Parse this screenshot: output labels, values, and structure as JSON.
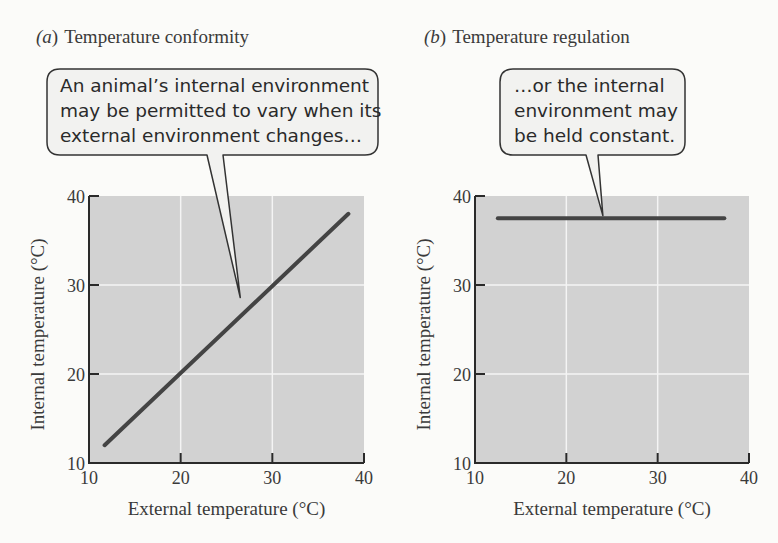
{
  "panels": [
    {
      "letter": "(a)",
      "title": "Temperature conformity",
      "callout": [
        "An animal’s internal environment",
        "may be permitted to vary when its",
        "external environment changes…"
      ]
    },
    {
      "letter": "(b)",
      "title": "Temperature regulation",
      "callout": [
        "…or the internal",
        "environment may",
        "be held constant."
      ]
    }
  ],
  "colors": {
    "plot_bg": "#d2d2d2",
    "grid": "#f4f4f4",
    "line": "#444444",
    "axis": "#2a2a2a",
    "bubble_fill": "#f2f2f0",
    "bubble_stroke": "#333333"
  },
  "chart_data": [
    {
      "type": "line",
      "title": "(a) Temperature conformity",
      "xlabel": "External temperature (°C)",
      "ylabel": "Internal temperature (°C)",
      "xlim": [
        10,
        40
      ],
      "ylim": [
        10,
        40
      ],
      "xticks": [
        "10",
        "20",
        "30",
        "40"
      ],
      "yticks": [
        "10",
        "20",
        "30",
        "40"
      ],
      "grid": true,
      "series": [
        {
          "name": "Internal temperature",
          "x": [
            11.7,
            38.3
          ],
          "y": [
            12,
            38
          ]
        }
      ],
      "annotations": [
        {
          "text": "An animal’s internal environment may be permitted to vary when its external environment changes…",
          "points_to": [
            26.5,
            28.6
          ]
        }
      ]
    },
    {
      "type": "line",
      "title": "(b) Temperature regulation",
      "xlabel": "External temperature (°C)",
      "ylabel": "Internal temperature (°C)",
      "xlim": [
        10,
        40
      ],
      "ylim": [
        10,
        40
      ],
      "xticks": [
        "10",
        "20",
        "30",
        "40"
      ],
      "yticks": [
        "10",
        "20",
        "30",
        "40"
      ],
      "grid": true,
      "series": [
        {
          "name": "Internal temperature",
          "x": [
            12.5,
            37.3
          ],
          "y": [
            37.5,
            37.5
          ]
        }
      ],
      "annotations": [
        {
          "text": "…or the internal environment may be held constant.",
          "points_to": [
            24,
            37.8
          ]
        }
      ]
    }
  ]
}
